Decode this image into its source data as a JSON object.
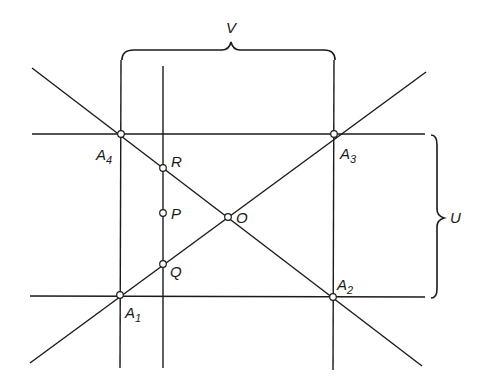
{
  "figure": {
    "braces": {
      "top": {
        "label": "V"
      },
      "right": {
        "label": "U"
      }
    },
    "points": {
      "A1": {
        "main": "A",
        "sub": "1"
      },
      "A2": {
        "main": "A",
        "sub": "2"
      },
      "A3": {
        "main": "A",
        "sub": "3"
      },
      "A4": {
        "main": "A",
        "sub": "4"
      },
      "O": {
        "main": "O"
      },
      "P": {
        "main": "P"
      },
      "Q": {
        "main": "Q"
      },
      "R": {
        "main": "R"
      }
    }
  }
}
